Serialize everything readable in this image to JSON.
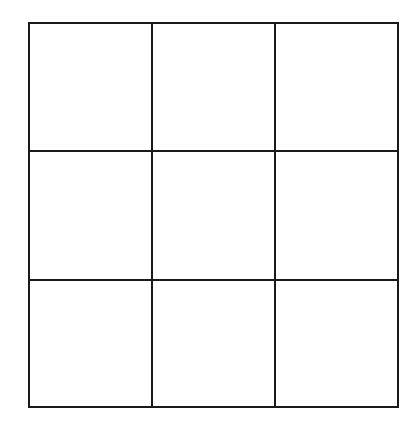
{
  "diagram": {
    "type": "grid",
    "rows": 3,
    "columns": 3,
    "line_color": "#1a1a1a",
    "background_color": "#ffffff",
    "cells": [
      [
        "",
        "",
        ""
      ],
      [
        "",
        "",
        ""
      ],
      [
        "",
        "",
        ""
      ]
    ]
  }
}
